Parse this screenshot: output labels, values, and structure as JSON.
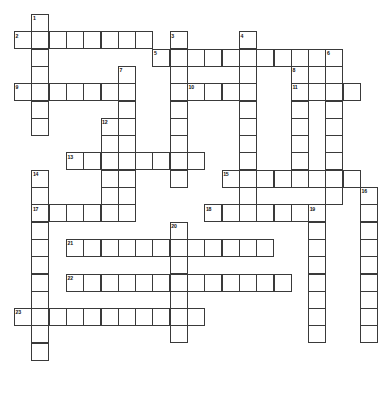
{
  "puzzle": {
    "title": "Crossword Puzzle Grid",
    "type": "crossword",
    "cell_size": 17.3,
    "origin_x": 14,
    "origin_y": 14,
    "columns": 21,
    "rows": 21,
    "border_color": "#3a3a3a",
    "cell_fill": "#ffffff",
    "background": "#ffffff",
    "number_color": "#111111",
    "entries": [
      {
        "number": "1",
        "direction": "down",
        "col": 1,
        "row": 0,
        "length": 7
      },
      {
        "number": "2",
        "direction": "across",
        "col": 0,
        "row": 1,
        "length": 8
      },
      {
        "number": "3",
        "direction": "down",
        "col": 9,
        "row": 1,
        "length": 9
      },
      {
        "number": "4",
        "direction": "down",
        "col": 13,
        "row": 1,
        "length": 10
      },
      {
        "number": "5",
        "direction": "across",
        "col": 8,
        "row": 2,
        "length": 10
      },
      {
        "number": "6",
        "direction": "down",
        "col": 18,
        "row": 2,
        "length": 9
      },
      {
        "number": "7",
        "direction": "down",
        "col": 6,
        "row": 3,
        "length": 8
      },
      {
        "number": "8",
        "direction": "down",
        "col": 16,
        "row": 3,
        "length": 7
      },
      {
        "number": "9",
        "direction": "across",
        "col": 0,
        "row": 4,
        "length": 7
      },
      {
        "number": "10",
        "direction": "across",
        "col": 10,
        "row": 4,
        "length": 4
      },
      {
        "number": "11",
        "direction": "across",
        "col": 16,
        "row": 4,
        "length": 4
      },
      {
        "number": "12",
        "direction": "down",
        "col": 5,
        "row": 6,
        "length": 6
      },
      {
        "number": "13",
        "direction": "across",
        "col": 3,
        "row": 8,
        "length": 8
      },
      {
        "number": "14",
        "direction": "down",
        "col": 1,
        "row": 9,
        "length": 11
      },
      {
        "number": "15",
        "direction": "across",
        "col": 12,
        "row": 9,
        "length": 8
      },
      {
        "number": "16",
        "direction": "down",
        "col": 20,
        "row": 10,
        "length": 9
      },
      {
        "number": "17",
        "direction": "across",
        "col": 1,
        "row": 11,
        "length": 6
      },
      {
        "number": "18",
        "direction": "across",
        "col": 11,
        "row": 11,
        "length": 7
      },
      {
        "number": "19",
        "direction": "down",
        "col": 17,
        "row": 11,
        "length": 8
      },
      {
        "number": "20",
        "direction": "down",
        "col": 9,
        "row": 12,
        "length": 7
      },
      {
        "number": "21",
        "direction": "across",
        "col": 3,
        "row": 13,
        "length": 12
      },
      {
        "number": "22",
        "direction": "across",
        "col": 3,
        "row": 15,
        "length": 13
      },
      {
        "number": "23",
        "direction": "across",
        "col": 0,
        "row": 17,
        "length": 11
      }
    ]
  }
}
